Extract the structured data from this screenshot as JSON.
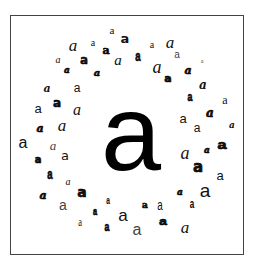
{
  "figure": {
    "center_glyph": {
      "char": "a",
      "style": "sans"
    },
    "ring_glyphs": [
      {
        "char": "a",
        "x": 112,
        "y": 30,
        "size": 11,
        "font": "f-serif",
        "extra": ""
      },
      {
        "char": "a",
        "x": 125,
        "y": 38,
        "size": 13,
        "font": "f-dsans",
        "extra": "w-bold"
      },
      {
        "char": "a",
        "x": 73,
        "y": 45,
        "size": 17,
        "font": "f-serif",
        "extra": "s-italic"
      },
      {
        "char": "a",
        "x": 93,
        "y": 43,
        "size": 10,
        "font": "f-serif",
        "extra": ""
      },
      {
        "char": "a",
        "x": 106,
        "y": 50,
        "size": 11,
        "font": "f-dserif",
        "extra": "w-heavy"
      },
      {
        "char": "a",
        "x": 152,
        "y": 45,
        "size": 10,
        "font": "f-serif",
        "extra": ""
      },
      {
        "char": "a",
        "x": 170,
        "y": 42,
        "size": 17,
        "font": "f-serif",
        "extra": "s-italic"
      },
      {
        "char": "a",
        "x": 58,
        "y": 60,
        "size": 10,
        "font": "f-serif",
        "extra": "s-italic"
      },
      {
        "char": "a",
        "x": 84,
        "y": 59,
        "size": 13,
        "font": "f-dmono",
        "extra": "w-heavy"
      },
      {
        "char": "a",
        "x": 118,
        "y": 60,
        "size": 15,
        "font": "f-serif",
        "extra": "s-italic"
      },
      {
        "char": "a",
        "x": 138,
        "y": 57,
        "size": 14,
        "font": "f-mono",
        "extra": "w-heavy narrow"
      },
      {
        "char": "a",
        "x": 177,
        "y": 55,
        "size": 10,
        "font": "f-sans",
        "extra": "c-gray"
      },
      {
        "char": "a",
        "x": 202,
        "y": 61,
        "size": 6,
        "font": "f-serif",
        "extra": "c-gray"
      },
      {
        "char": "a",
        "x": 67,
        "y": 70,
        "size": 9,
        "font": "f-dserif",
        "extra": "w-heavy s-italic"
      },
      {
        "char": "a",
        "x": 97,
        "y": 73,
        "size": 10,
        "font": "f-dserif",
        "extra": "w-heavy s-italic"
      },
      {
        "char": "a",
        "x": 157,
        "y": 67,
        "size": 18,
        "font": "f-serif",
        "extra": "s-italic"
      },
      {
        "char": "a",
        "x": 168,
        "y": 78,
        "size": 11,
        "font": "f-dsans",
        "extra": "w-heavy"
      },
      {
        "char": "a",
        "x": 188,
        "y": 70,
        "size": 11,
        "font": "f-dserif",
        "extra": "w-heavy s-italic"
      },
      {
        "char": "a",
        "x": 47,
        "y": 88,
        "size": 11,
        "font": "f-dserif",
        "extra": "w-bold s-italic"
      },
      {
        "char": "a",
        "x": 77,
        "y": 88,
        "size": 12,
        "font": "f-sans",
        "extra": ""
      },
      {
        "char": "a",
        "x": 57,
        "y": 103,
        "size": 12,
        "font": "f-dsans",
        "extra": "w-heavy"
      },
      {
        "char": "a",
        "x": 38,
        "y": 108,
        "size": 13,
        "font": "f-sans",
        "extra": ""
      },
      {
        "char": "a",
        "x": 77,
        "y": 110,
        "size": 16,
        "font": "f-serif",
        "extra": "s-italic"
      },
      {
        "char": "a",
        "x": 190,
        "y": 97,
        "size": 13,
        "font": "f-mono",
        "extra": "w-heavy narrow"
      },
      {
        "char": "a",
        "x": 203,
        "y": 85,
        "size": 12,
        "font": "f-dserif",
        "extra": "w-bold s-italic"
      },
      {
        "char": "a",
        "x": 225,
        "y": 100,
        "size": 12,
        "font": "f-serif",
        "extra": ""
      },
      {
        "char": "a",
        "x": 183,
        "y": 118,
        "size": 13,
        "font": "f-sans",
        "extra": ""
      },
      {
        "char": "a",
        "x": 210,
        "y": 113,
        "size": 12,
        "font": "f-dserif",
        "extra": "w-heavy s-italic"
      },
      {
        "char": "a",
        "x": 197,
        "y": 128,
        "size": 12,
        "font": "f-sans",
        "extra": ""
      },
      {
        "char": "a",
        "x": 232,
        "y": 125,
        "size": 9,
        "font": "f-dserif",
        "extra": "w-bold s-italic"
      },
      {
        "char": "a",
        "x": 40,
        "y": 128,
        "size": 11,
        "font": "f-dserif",
        "extra": "w-heavy s-italic"
      },
      {
        "char": "a",
        "x": 62,
        "y": 125,
        "size": 17,
        "font": "f-serif",
        "extra": "s-italic"
      },
      {
        "char": "a",
        "x": 23,
        "y": 143,
        "size": 16,
        "font": "f-sans",
        "extra": ""
      },
      {
        "char": "a",
        "x": 53,
        "y": 145,
        "size": 13,
        "font": "f-serif",
        "extra": "s-italic c-gray"
      },
      {
        "char": "a",
        "x": 38,
        "y": 160,
        "size": 10,
        "font": "f-dsans",
        "extra": "w-heavy"
      },
      {
        "char": "a",
        "x": 65,
        "y": 155,
        "size": 13,
        "font": "f-dsans",
        "extra": ""
      },
      {
        "char": "a",
        "x": 185,
        "y": 153,
        "size": 18,
        "font": "f-serif",
        "extra": "s-italic"
      },
      {
        "char": "a",
        "x": 207,
        "y": 150,
        "size": 9,
        "font": "f-dserif",
        "extra": "w-heavy s-italic"
      },
      {
        "char": "a",
        "x": 222,
        "y": 145,
        "size": 13,
        "font": "f-mono",
        "extra": "w-heavy wide"
      },
      {
        "char": "a",
        "x": 198,
        "y": 167,
        "size": 15,
        "font": "f-dsans",
        "extra": "w-heavy"
      },
      {
        "char": "a",
        "x": 220,
        "y": 175,
        "size": 13,
        "font": "f-sans",
        "extra": ""
      },
      {
        "char": "a",
        "x": 50,
        "y": 175,
        "size": 14,
        "font": "f-mono",
        "extra": "w-heavy narrow"
      },
      {
        "char": "a",
        "x": 68,
        "y": 182,
        "size": 10,
        "font": "f-serif",
        "extra": "s-italic"
      },
      {
        "char": "a",
        "x": 43,
        "y": 195,
        "size": 11,
        "font": "f-dserif",
        "extra": "w-heavy s-italic"
      },
      {
        "char": "a",
        "x": 82,
        "y": 192,
        "size": 14,
        "font": "f-dsans",
        "extra": "w-heavy"
      },
      {
        "char": "a",
        "x": 63,
        "y": 205,
        "size": 14,
        "font": "f-sans",
        "extra": "c-gray"
      },
      {
        "char": "a",
        "x": 180,
        "y": 192,
        "size": 9,
        "font": "f-dserif",
        "extra": "w-heavy s-italic"
      },
      {
        "char": "a",
        "x": 205,
        "y": 190,
        "size": 19,
        "font": "f-sans",
        "extra": ""
      },
      {
        "char": "a",
        "x": 192,
        "y": 205,
        "size": 12,
        "font": "f-mono",
        "extra": "w-bold narrow"
      },
      {
        "char": "a",
        "x": 145,
        "y": 205,
        "size": 9,
        "font": "f-dserif",
        "extra": "w-heavy"
      },
      {
        "char": "a",
        "x": 160,
        "y": 205,
        "size": 14,
        "font": "f-sans",
        "extra": "narrow"
      },
      {
        "char": "a",
        "x": 108,
        "y": 202,
        "size": 10,
        "font": "f-mono",
        "extra": "w-bold narrow"
      },
      {
        "char": "a",
        "x": 95,
        "y": 212,
        "size": 11,
        "font": "f-mono",
        "extra": "w-heavy narrow"
      },
      {
        "char": "a",
        "x": 123,
        "y": 215,
        "size": 17,
        "font": "f-sans",
        "extra": ""
      },
      {
        "char": "a",
        "x": 80,
        "y": 222,
        "size": 12,
        "font": "f-serif",
        "extra": "narrow"
      },
      {
        "char": "a",
        "x": 107,
        "y": 227,
        "size": 13,
        "font": "f-mono",
        "extra": "w-heavy narrow"
      },
      {
        "char": "a",
        "x": 137,
        "y": 230,
        "size": 16,
        "font": "f-sans",
        "extra": "c-gray"
      },
      {
        "char": "a",
        "x": 163,
        "y": 222,
        "size": 11,
        "font": "f-mono",
        "extra": "w-heavy wide"
      },
      {
        "char": "a",
        "x": 185,
        "y": 227,
        "size": 17,
        "font": "f-serif",
        "extra": "s-italic"
      }
    ]
  }
}
